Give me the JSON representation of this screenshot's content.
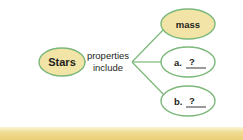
{
  "diagram": {
    "type": "concept-map",
    "colors": {
      "line": "#7cb87a",
      "filled_node": "#f2e3a6",
      "empty_node": "#ffffff",
      "text": "#231f20",
      "band_light": "#faf3d8",
      "band_dark": "#e9cf74"
    },
    "root": {
      "label": "Stars"
    },
    "link_label": {
      "line1": "properties",
      "line2": "include"
    },
    "branches": [
      {
        "prefix": "",
        "label": "mass",
        "filled": true
      },
      {
        "prefix": "a.",
        "label": "?",
        "filled": false
      },
      {
        "prefix": "b.",
        "label": "?",
        "filled": false
      }
    ]
  }
}
